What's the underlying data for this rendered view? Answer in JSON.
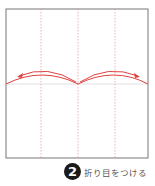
{
  "diagram": {
    "type": "origami-step",
    "paper": {
      "x": 6,
      "y": 9,
      "width": 142,
      "height": 149,
      "border_color": "#777777"
    },
    "guide_lines": {
      "color": "#e8a0a0",
      "vertical_x": [
        41,
        78,
        115
      ],
      "horizontal_y": 84
    },
    "fold_curve_color": "#e04040",
    "arrows": [
      "left-arrow",
      "right-arrow"
    ]
  },
  "step": {
    "number": "2",
    "caption": "折り目をつける"
  }
}
